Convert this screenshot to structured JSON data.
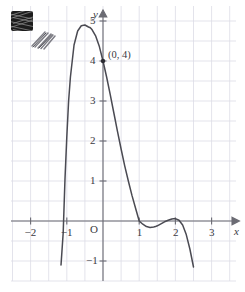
{
  "figure": {
    "kind": "coordinate-graph",
    "background": "#ffffff",
    "grid_color": "#dcdce6",
    "axis_color": "#6b6b73",
    "curve_color": "#4a4a52",
    "label_color": "#3a3a42"
  },
  "axes": {
    "x_label": "x",
    "y_label": "y",
    "origin_label": "O",
    "x_ticks": [
      {
        "value": -2,
        "label": "−2"
      },
      {
        "value": -1,
        "label": "−1"
      },
      {
        "value": 1,
        "label": "1"
      },
      {
        "value": 2,
        "label": "2"
      },
      {
        "value": 3,
        "label": "3"
      }
    ],
    "y_ticks": [
      {
        "value": 5,
        "label": "5"
      },
      {
        "value": 4,
        "label": "4"
      },
      {
        "value": 3,
        "label": "3"
      },
      {
        "value": 2,
        "label": "2"
      },
      {
        "value": 1,
        "label": "1"
      },
      {
        "value": -1,
        "label": "−1"
      }
    ],
    "x_range": [
      -2.75,
      3.4
    ],
    "y_range": [
      -1.35,
      5.45
    ],
    "grid_step": 0.5,
    "grid": true
  },
  "annotations": [
    {
      "name": "y-intercept",
      "label": "(0, 4)",
      "x": 0,
      "y": 4,
      "marker": "dot"
    }
  ],
  "chart_data": {
    "type": "line",
    "title": "",
    "xlabel": "x",
    "ylabel": "y",
    "xlim": [
      -2.75,
      3.4
    ],
    "ylim": [
      -1.35,
      5.45
    ],
    "grid": true,
    "legend": "none",
    "series": [
      {
        "name": "curve",
        "comment": "quartic, roots: simple near x=-1.08, double at x=1, double at x=2; y-intercept 4",
        "x": [
          -1.16,
          -1.1,
          -1.05,
          -1.0,
          -0.95,
          -0.9,
          -0.8,
          -0.7,
          -0.6,
          -0.5,
          -0.4,
          -0.35,
          -0.3,
          -0.2,
          -0.1,
          0.0,
          0.1,
          0.2,
          0.3,
          0.4,
          0.5,
          0.6,
          0.7,
          0.8,
          0.9,
          1.0,
          1.1,
          1.2,
          1.3,
          1.4,
          1.45,
          1.5,
          1.6,
          1.7,
          1.8,
          1.9,
          2.0,
          2.1,
          2.2,
          2.3,
          2.4,
          2.5
        ],
        "y": [
          -1.1,
          -0.3,
          1.05,
          2.1,
          3.0,
          3.6,
          4.4,
          4.75,
          4.88,
          4.9,
          4.85,
          4.83,
          4.78,
          4.62,
          4.36,
          4.0,
          3.6,
          3.16,
          2.7,
          2.24,
          1.8,
          1.38,
          1.0,
          0.64,
          0.32,
          0.0,
          -0.08,
          -0.14,
          -0.16,
          -0.15,
          -0.14,
          -0.12,
          -0.07,
          -0.02,
          0.02,
          0.05,
          0.06,
          0.02,
          -0.1,
          -0.34,
          -0.7,
          -1.15
        ],
        "key_points": [
          {
            "x": 0,
            "y": 4,
            "label": "(0, 4)"
          },
          {
            "x": 1,
            "y": 0,
            "label": "touch"
          },
          {
            "x": 2,
            "y": 0,
            "label": "touch"
          }
        ]
      }
    ]
  },
  "artifact": {
    "name": "scan-stamp",
    "description": "small dark illegible stamp with pencil scribble beside it",
    "text": ""
  }
}
